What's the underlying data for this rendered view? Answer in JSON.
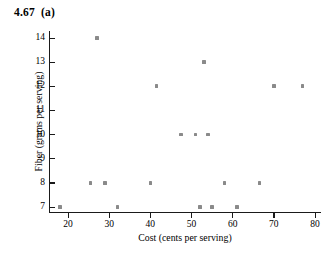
{
  "figure": {
    "title": "4.67  (a)"
  },
  "chart_data": {
    "type": "scatter",
    "title": "4.67  (a)",
    "xlabel": "Cost (cents per serving)",
    "ylabel": "Fiber (grams per serving)",
    "xlim": [
      15,
      81
    ],
    "ylim": [
      6.6,
      14.4
    ],
    "xticks": [
      20,
      30,
      40,
      50,
      60,
      70,
      80
    ],
    "xticklabels": [
      "20",
      "30",
      "40",
      "50",
      "60",
      "70",
      "80"
    ],
    "yticks": [
      7,
      8,
      9,
      10,
      11,
      12,
      13,
      14
    ],
    "yticklabels": [
      "7",
      "8",
      "9",
      "10",
      "11",
      "12",
      "13",
      "14"
    ],
    "grid": false,
    "legend": false,
    "marker": "square",
    "marker_color": "#8a8a8a",
    "points": [
      {
        "x": 18,
        "y": 7
      },
      {
        "x": 25.5,
        "y": 8
      },
      {
        "x": 27,
        "y": 14
      },
      {
        "x": 29,
        "y": 8
      },
      {
        "x": 32,
        "y": 7
      },
      {
        "x": 40,
        "y": 8
      },
      {
        "x": 41.5,
        "y": 12
      },
      {
        "x": 47.5,
        "y": 10
      },
      {
        "x": 51,
        "y": 10
      },
      {
        "x": 52,
        "y": 7
      },
      {
        "x": 53,
        "y": 13
      },
      {
        "x": 54,
        "y": 10
      },
      {
        "x": 55,
        "y": 7
      },
      {
        "x": 58,
        "y": 8
      },
      {
        "x": 61,
        "y": 7
      },
      {
        "x": 66.5,
        "y": 8
      },
      {
        "x": 70,
        "y": 12
      },
      {
        "x": 77,
        "y": 12
      }
    ]
  }
}
